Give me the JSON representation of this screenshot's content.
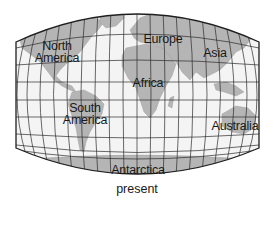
{
  "map": {
    "projection": "curved world map with latitude/longitude grid",
    "colors": {
      "ocean": "#f4f4f4",
      "land": "#b5b5b5",
      "grid": "#2b2b2b",
      "border": "#1f1f1f",
      "text": "#1a1a1a"
    },
    "labels": {
      "north_america_line1": "North",
      "north_america_line2": "America",
      "europe": "Europe",
      "asia": "Asia",
      "africa": "Africa",
      "south_america_line1": "South",
      "south_america_line2": "America",
      "australia": "Australia",
      "antarctica": "Antarctica"
    }
  },
  "caption": "present"
}
